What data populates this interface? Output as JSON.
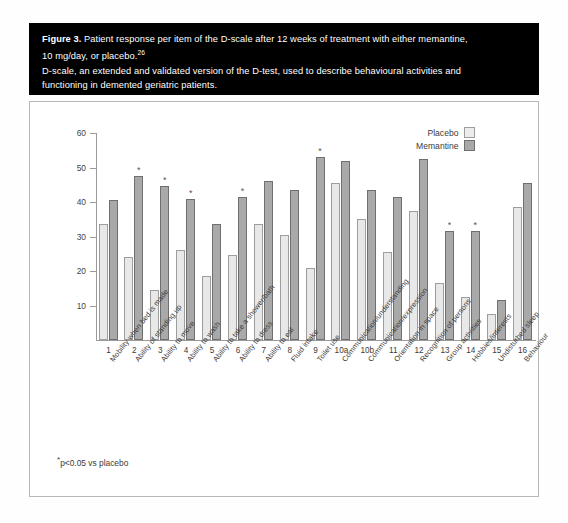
{
  "figure": {
    "label": "Figure 3.",
    "caption_line1": "Patient response per item of the D-scale after 12 weeks of treatment with either memantine,",
    "caption_line2": "10 mg/day, or placebo.",
    "caption_ref": "26",
    "caption_line3": "D-scale, an extended and validated version of the D-test, used to describe behavioural activities and",
    "caption_line4": "functioning in demented geriatric patients."
  },
  "footnote": {
    "star": "*",
    "text": "p<0.05 vs placebo"
  },
  "legend": {
    "position": "top-right",
    "entries": [
      {
        "label": "Placebo",
        "color": "#ececec"
      },
      {
        "label": "Memantine",
        "color": "#a9a9a9"
      }
    ]
  },
  "chart_data": {
    "type": "bar",
    "title": "Patient response per item of the D-scale after 12 weeks of treatment with either memantine, 10 mg/day, or placebo",
    "xlabel": "",
    "ylabel": "Frequency of improvement (%)",
    "ylim": [
      0,
      60
    ],
    "yticks": [
      0,
      10,
      20,
      30,
      40,
      50,
      60
    ],
    "ytick_labels": [
      "",
      "10",
      "20",
      "30",
      "40",
      "50",
      "60"
    ],
    "grid": false,
    "legend_position": "upper right",
    "item_numbers": [
      "1",
      "2",
      "3",
      "4",
      "5",
      "6",
      "7",
      "8",
      "9",
      "10a",
      "10b",
      "11",
      "12",
      "13",
      "14",
      "15",
      "16"
    ],
    "categories": [
      "Mobility when bed is made",
      "Ability of standing up",
      "Ability to move",
      "Ability to wash",
      "Ability to take a shower/bath",
      "Ability to dress",
      "Ability to eat",
      "Fluid intake",
      "Toilet use",
      "Communication/understanding",
      "Communication/expression",
      "Orientation in space",
      "Recognition of persons",
      "Group activities",
      "Hobbies/interests",
      "Undisturbed sleep",
      "Behaviour"
    ],
    "series": [
      {
        "name": "Placebo",
        "color": "#ececec",
        "values": [
          33.5,
          24.0,
          14.5,
          26.0,
          18.5,
          24.5,
          33.5,
          30.5,
          21.0,
          45.5,
          35.0,
          25.5,
          37.5,
          16.5,
          12.5,
          7.5,
          38.5
        ]
      },
      {
        "name": "Memantine",
        "color": "#a9a9a9",
        "values": [
          40.5,
          47.5,
          44.5,
          41.0,
          33.5,
          41.5,
          46.0,
          43.5,
          53.0,
          52.0,
          43.5,
          41.5,
          52.5,
          31.5,
          31.5,
          11.5,
          45.5
        ]
      }
    ],
    "significance_markers": {
      "symbol": "*",
      "applies_to_series": "Memantine",
      "item_numbers": [
        "2",
        "3",
        "4",
        "6",
        "9",
        "13",
        "14"
      ]
    },
    "annotations": [
      "*p<0.05 vs placebo"
    ]
  }
}
